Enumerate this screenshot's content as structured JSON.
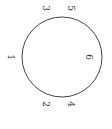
{
  "diagram": {
    "circle": {
      "cx": 62,
      "cy": 57,
      "r": 40,
      "stroke": "#444444"
    },
    "labels": [
      {
        "text": "1",
        "x": 10,
        "y": 57
      },
      {
        "text": "2",
        "x": 45,
        "y": 104
      },
      {
        "text": "3",
        "x": 45,
        "y": 8
      },
      {
        "text": "4",
        "x": 70,
        "y": 104
      },
      {
        "text": "5",
        "x": 70,
        "y": 8
      },
      {
        "text": "6",
        "x": 88,
        "y": 57
      }
    ]
  }
}
